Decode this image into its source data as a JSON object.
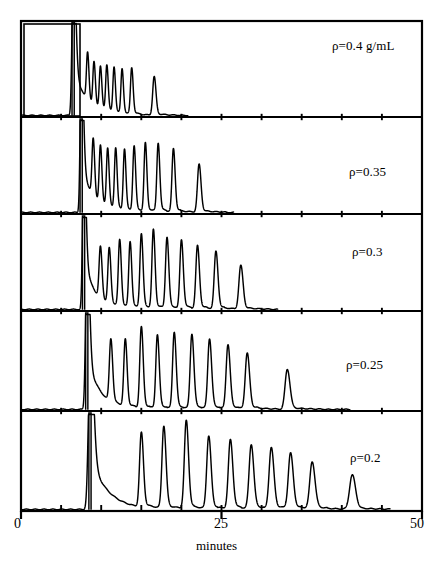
{
  "figure": {
    "type": "chromatogram-stack",
    "background": "#ffffff",
    "ink_color": "#000000"
  },
  "axis": {
    "xlabel": "minutes",
    "xlim": [
      0,
      50
    ],
    "tick_labels": [
      "0",
      "25",
      "50"
    ],
    "tick_values": [
      0,
      25,
      50
    ],
    "minor_tick_step": 5,
    "label_0": "0",
    "label_25": "25",
    "label_50": "50"
  },
  "panels": [
    {
      "id": "panel-rho-0-4",
      "label": "ρ=0.4 g/mL",
      "density": 0.4,
      "units": "g/mL",
      "solvent_peak": {
        "x": 6.5,
        "height": 1.0,
        "width": 0.28
      },
      "peaks": [
        {
          "x": 8.3,
          "h": 0.52,
          "w": 0.17
        },
        {
          "x": 9.1,
          "h": 0.47,
          "w": 0.17
        },
        {
          "x": 9.9,
          "h": 0.46,
          "w": 0.17
        },
        {
          "x": 10.7,
          "h": 0.5,
          "w": 0.17
        },
        {
          "x": 11.6,
          "h": 0.49,
          "w": 0.17
        },
        {
          "x": 12.6,
          "h": 0.48,
          "w": 0.17
        },
        {
          "x": 13.8,
          "h": 0.5,
          "w": 0.18
        },
        {
          "x": 16.6,
          "h": 0.42,
          "w": 0.22
        }
      ],
      "baseline_end": 20.8
    },
    {
      "id": "panel-rho-0-35",
      "label": "ρ=0.35",
      "density": 0.35,
      "units": "",
      "solvent_peak": {
        "x": 7.5,
        "height": 1.0,
        "width": 0.25
      },
      "peaks": [
        {
          "x": 9.0,
          "h": 0.62,
          "w": 0.18
        },
        {
          "x": 9.9,
          "h": 0.62,
          "w": 0.18
        },
        {
          "x": 10.8,
          "h": 0.63,
          "w": 0.18
        },
        {
          "x": 11.8,
          "h": 0.66,
          "w": 0.18
        },
        {
          "x": 12.9,
          "h": 0.66,
          "w": 0.18
        },
        {
          "x": 14.1,
          "h": 0.7,
          "w": 0.19
        },
        {
          "x": 15.5,
          "h": 0.74,
          "w": 0.19
        },
        {
          "x": 17.1,
          "h": 0.74,
          "w": 0.2
        },
        {
          "x": 19.0,
          "h": 0.68,
          "w": 0.21
        },
        {
          "x": 22.2,
          "h": 0.52,
          "w": 0.24
        }
      ],
      "baseline_end": 26.5
    },
    {
      "id": "panel-rho-0-3",
      "label": "ρ=0.3",
      "density": 0.3,
      "units": "",
      "solvent_peak": {
        "x": 7.8,
        "height": 1.0,
        "width": 0.26
      },
      "peaks": [
        {
          "x": 9.9,
          "h": 0.56,
          "w": 0.2
        },
        {
          "x": 11.0,
          "h": 0.6,
          "w": 0.2
        },
        {
          "x": 12.3,
          "h": 0.72,
          "w": 0.2
        },
        {
          "x": 13.6,
          "h": 0.71,
          "w": 0.2
        },
        {
          "x": 15.0,
          "h": 0.8,
          "w": 0.21
        },
        {
          "x": 16.5,
          "h": 0.85,
          "w": 0.21
        },
        {
          "x": 18.2,
          "h": 0.77,
          "w": 0.22
        },
        {
          "x": 20.0,
          "h": 0.74,
          "w": 0.23
        },
        {
          "x": 22.0,
          "h": 0.68,
          "w": 0.24
        },
        {
          "x": 24.3,
          "h": 0.62,
          "w": 0.25
        },
        {
          "x": 27.4,
          "h": 0.47,
          "w": 0.28
        }
      ],
      "baseline_end": 32.0
    },
    {
      "id": "panel-rho-0-25",
      "label": "ρ=0.25",
      "density": 0.25,
      "units": "",
      "solvent_peak": {
        "x": 8.2,
        "height": 1.0,
        "width": 0.3
      },
      "peaks": [
        {
          "x": 11.2,
          "h": 0.66,
          "w": 0.22
        },
        {
          "x": 13.0,
          "h": 0.7,
          "w": 0.22
        },
        {
          "x": 15.0,
          "h": 0.85,
          "w": 0.23
        },
        {
          "x": 17.0,
          "h": 0.77,
          "w": 0.23
        },
        {
          "x": 19.1,
          "h": 0.8,
          "w": 0.24
        },
        {
          "x": 21.3,
          "h": 0.78,
          "w": 0.25
        },
        {
          "x": 23.5,
          "h": 0.73,
          "w": 0.26
        },
        {
          "x": 25.8,
          "h": 0.67,
          "w": 0.27
        },
        {
          "x": 28.2,
          "h": 0.58,
          "w": 0.29
        },
        {
          "x": 33.2,
          "h": 0.42,
          "w": 0.33
        }
      ],
      "baseline_end": 41.0
    },
    {
      "id": "panel-rho-0-2",
      "label": "ρ=0.2",
      "density": 0.2,
      "units": "",
      "solvent_peak": {
        "x": 8.6,
        "height": 1.0,
        "width": 0.4
      },
      "peaks": [
        {
          "x": 15.0,
          "h": 0.78,
          "w": 0.26
        },
        {
          "x": 17.8,
          "h": 0.86,
          "w": 0.27
        },
        {
          "x": 20.6,
          "h": 0.92,
          "w": 0.28
        },
        {
          "x": 23.4,
          "h": 0.76,
          "w": 0.29
        },
        {
          "x": 26.1,
          "h": 0.72,
          "w": 0.3
        },
        {
          "x": 28.7,
          "h": 0.67,
          "w": 0.31
        },
        {
          "x": 31.2,
          "h": 0.64,
          "w": 0.32
        },
        {
          "x": 33.6,
          "h": 0.58,
          "w": 0.33
        },
        {
          "x": 36.3,
          "h": 0.49,
          "w": 0.35
        },
        {
          "x": 41.3,
          "h": 0.36,
          "w": 0.4
        }
      ],
      "baseline_end": 46.0
    }
  ],
  "chart_data": {
    "type": "line",
    "title": "",
    "subtitle": "",
    "xlabel": "minutes",
    "ylabel": "",
    "xlim": [
      0,
      50
    ],
    "xticks": [
      0,
      25,
      50
    ],
    "xticklabels": [
      "0",
      "25",
      "50"
    ],
    "minor_xtick_step": 5,
    "grid": false,
    "legend": "none",
    "stacked_panels": true,
    "panel_count": 5,
    "series": [
      {
        "name": "ρ=0.4 g/mL",
        "panel": 1,
        "solvent_peak_minutes": 6.5,
        "peak_minutes": [
          8.3,
          9.1,
          9.9,
          10.7,
          11.6,
          12.6,
          13.8,
          16.6
        ],
        "peak_relative_heights": [
          0.52,
          0.47,
          0.46,
          0.5,
          0.49,
          0.48,
          0.5,
          0.42
        ],
        "n_resolved_peaks": 8,
        "elution_window_minutes": [
          6.5,
          17.5
        ]
      },
      {
        "name": "ρ=0.35",
        "panel": 2,
        "solvent_peak_minutes": 7.5,
        "peak_minutes": [
          9.0,
          9.9,
          10.8,
          11.8,
          12.9,
          14.1,
          15.5,
          17.1,
          19.0,
          22.2
        ],
        "peak_relative_heights": [
          0.62,
          0.62,
          0.63,
          0.66,
          0.66,
          0.7,
          0.74,
          0.74,
          0.68,
          0.52
        ],
        "n_resolved_peaks": 10,
        "elution_window_minutes": [
          7.5,
          23.5
        ]
      },
      {
        "name": "ρ=0.3",
        "panel": 3,
        "solvent_peak_minutes": 7.8,
        "peak_minutes": [
          9.9,
          11.0,
          12.3,
          13.6,
          15.0,
          16.5,
          18.2,
          20.0,
          22.0,
          24.3,
          27.4
        ],
        "peak_relative_heights": [
          0.56,
          0.6,
          0.72,
          0.71,
          0.8,
          0.85,
          0.77,
          0.74,
          0.68,
          0.62,
          0.47
        ],
        "n_resolved_peaks": 11,
        "elution_window_minutes": [
          7.8,
          29.0
        ]
      },
      {
        "name": "ρ=0.25",
        "panel": 4,
        "solvent_peak_minutes": 8.2,
        "peak_minutes": [
          11.2,
          13.0,
          15.0,
          17.0,
          19.1,
          21.3,
          23.5,
          25.8,
          28.2,
          33.2
        ],
        "peak_relative_heights": [
          0.66,
          0.7,
          0.85,
          0.77,
          0.8,
          0.78,
          0.73,
          0.67,
          0.58,
          0.42
        ],
        "n_resolved_peaks": 10,
        "elution_window_minutes": [
          8.2,
          35.0
        ]
      },
      {
        "name": "ρ=0.2",
        "panel": 5,
        "solvent_peak_minutes": 8.6,
        "peak_minutes": [
          15.0,
          17.8,
          20.6,
          23.4,
          26.1,
          28.7,
          31.2,
          33.6,
          36.3,
          41.3
        ],
        "peak_relative_heights": [
          0.78,
          0.86,
          0.92,
          0.76,
          0.72,
          0.67,
          0.64,
          0.58,
          0.49,
          0.36
        ],
        "n_resolved_peaks": 10,
        "elution_window_minutes": [
          8.6,
          43.0
        ]
      }
    ]
  }
}
